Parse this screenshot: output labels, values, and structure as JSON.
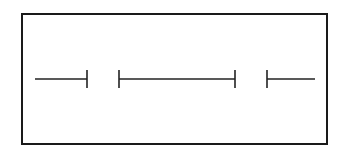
{
  "diagram": {
    "frame": {
      "x": 21,
      "y": 13,
      "width": 307,
      "height": 132,
      "stroke": "#1a1a1a"
    },
    "baseline_y": 79,
    "tick_half_height": 9,
    "stroke_color": "#222222",
    "segments": [
      {
        "x1": 35,
        "x2": 87,
        "left_tick": false,
        "right_tick": true
      },
      {
        "x1": 119,
        "x2": 235,
        "left_tick": true,
        "right_tick": true
      },
      {
        "x1": 267,
        "x2": 315,
        "left_tick": true,
        "right_tick": false
      }
    ]
  }
}
